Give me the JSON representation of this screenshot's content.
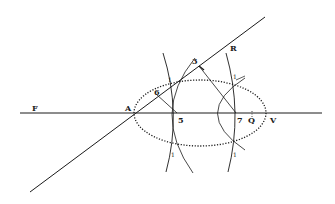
{
  "diagram": {
    "ink_color": "#1a1a1a",
    "background": "#ffffff",
    "labels": {
      "F": "F",
      "A": "A",
      "R": "R",
      "V": "V",
      "Q": "Q",
      "five": "5",
      "seven": "7",
      "three": "3",
      "six": "6",
      "one_a": "1",
      "one_b": "1",
      "one_c": "1",
      "one_d": "1"
    }
  }
}
